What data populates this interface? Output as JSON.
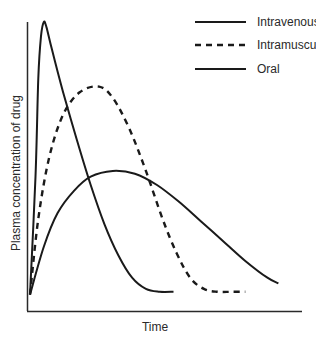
{
  "chart_data": {
    "type": "line",
    "title": "",
    "xlabel": "Time",
    "ylabel": "Plasma concentration of drug",
    "grid": false,
    "legend_position": "upper right",
    "axis_ticks": "none",
    "x_range": [
      0,
      100
    ],
    "y_range": [
      0,
      100
    ],
    "series": [
      {
        "name": "Intravenous",
        "style": "solid",
        "points": [
          [
            0,
            3
          ],
          [
            2,
            45
          ],
          [
            3,
            80
          ],
          [
            4,
            95
          ],
          [
            5,
            100
          ],
          [
            6,
            98
          ],
          [
            8,
            90
          ],
          [
            12,
            75
          ],
          [
            17,
            58
          ],
          [
            22,
            42
          ],
          [
            27,
            28
          ],
          [
            32,
            17
          ],
          [
            37,
            9
          ],
          [
            42,
            5
          ],
          [
            47,
            4
          ],
          [
            52,
            4
          ]
        ]
      },
      {
        "name": "Intramuscular",
        "style": "dashed",
        "points": [
          [
            0,
            3
          ],
          [
            3,
            30
          ],
          [
            7,
            52
          ],
          [
            12,
            67
          ],
          [
            18,
            75
          ],
          [
            25,
            77
          ],
          [
            30,
            73
          ],
          [
            36,
            62
          ],
          [
            42,
            47
          ],
          [
            48,
            30
          ],
          [
            53,
            18
          ],
          [
            58,
            9
          ],
          [
            63,
            5
          ],
          [
            68,
            4
          ],
          [
            73,
            4
          ],
          [
            78,
            4
          ]
        ]
      },
      {
        "name": "Oral",
        "style": "solid",
        "points": [
          [
            0,
            3
          ],
          [
            5,
            20
          ],
          [
            10,
            32
          ],
          [
            16,
            40
          ],
          [
            22,
            45
          ],
          [
            30,
            47
          ],
          [
            38,
            46
          ],
          [
            46,
            42
          ],
          [
            54,
            36
          ],
          [
            62,
            29
          ],
          [
            70,
            22
          ],
          [
            78,
            15
          ],
          [
            86,
            9
          ],
          [
            90,
            7
          ]
        ]
      }
    ]
  },
  "legend": {
    "items": [
      {
        "label": "Intravenous",
        "style": "solid"
      },
      {
        "label": "Intramuscular",
        "style": "dashed"
      },
      {
        "label": "Oral",
        "style": "solid"
      }
    ]
  },
  "axes": {
    "x_label": "Time",
    "y_label": "Plasma concentration of drug"
  }
}
